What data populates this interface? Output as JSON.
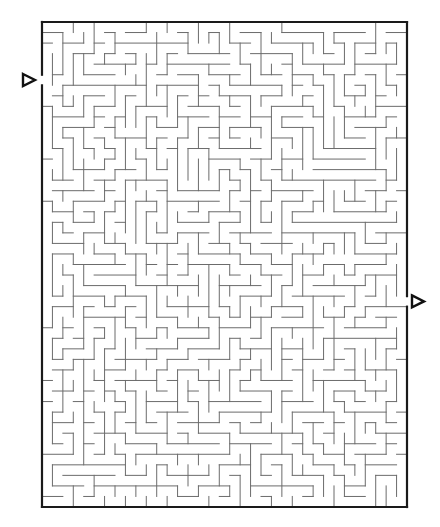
{
  "puzzle": {
    "type": "rectangular-maze",
    "cols": 35,
    "rows": 46,
    "origin": {
      "x": 42,
      "y": 22
    },
    "size": {
      "width": 365,
      "height": 485
    },
    "seed": 7919,
    "entrance": {
      "side": "left",
      "row": 5,
      "marker_direction": "right"
    },
    "exit": {
      "side": "right",
      "row": 26,
      "marker_direction": "right"
    },
    "colors": {
      "background": "#ffffff",
      "wall": "#6b6b6b",
      "border": "#1a1a1a",
      "marker_stroke": "#111111"
    }
  },
  "markers": {
    "start_label": "start",
    "finish_label": "finish"
  }
}
